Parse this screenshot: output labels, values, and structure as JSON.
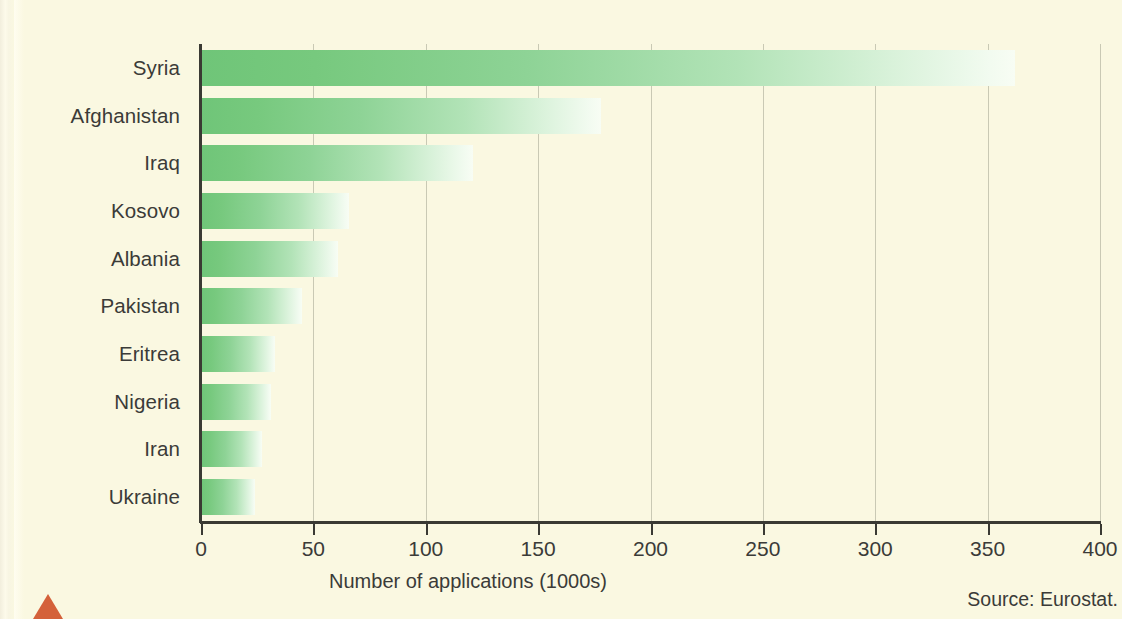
{
  "chart_data": {
    "type": "bar",
    "orientation": "horizontal",
    "title": "",
    "subtitle": "",
    "xlabel": "Number of applications (1000s)",
    "ylabel": "",
    "categories": [
      "Syria",
      "Afghanistan",
      "Iraq",
      "Kosovo",
      "Albania",
      "Pakistan",
      "Eritrea",
      "Nigeria",
      "Iran",
      "Ukraine"
    ],
    "values": [
      362,
      178,
      121,
      66,
      61,
      45,
      33,
      31,
      27,
      24
    ],
    "xlim": [
      0,
      400
    ],
    "ylim": null,
    "xticks": [
      0,
      50,
      100,
      150,
      200,
      250,
      300,
      350,
      400
    ],
    "xtick_labels": [
      "0",
      "50",
      "100",
      "150",
      "200",
      "250",
      "300",
      "350",
      "400"
    ],
    "grid": "vertical",
    "legend": null,
    "annotations": [
      "Source: Eurostat."
    ],
    "series": [
      {
        "name": "Number of applications (1000s)",
        "values": [
          362,
          178,
          121,
          66,
          61,
          45,
          33,
          31,
          27,
          24
        ]
      }
    ]
  },
  "axis": {
    "x_title": "Number of applications (1000s)",
    "tick_labels": [
      "0",
      "50",
      "100",
      "150",
      "200",
      "250",
      "300",
      "350",
      "400"
    ]
  },
  "categories": [
    "Syria",
    "Afghanistan",
    "Iraq",
    "Kosovo",
    "Albania",
    "Pakistan",
    "Eritrea",
    "Nigeria",
    "Iran",
    "Ukraine"
  ],
  "footer": {
    "source": "Source: Eurostat."
  },
  "colors": {
    "background": "#faf8e1",
    "bar_start": "#6fc578",
    "bar_end": "#f8fdf4",
    "axis": "#3a3a33",
    "gridline": "#c9c9b4",
    "text": "#3b3b38",
    "marker": "#d4613a"
  }
}
